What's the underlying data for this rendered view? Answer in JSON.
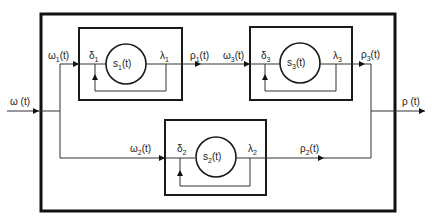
{
  "diagram": {
    "type": "block-diagram",
    "input": {
      "label": "ω",
      "suffix": " (t)"
    },
    "output": {
      "label": "ρ",
      "suffix": " (t)"
    },
    "blocks": [
      {
        "id": "s1",
        "state": "s",
        "index": "1",
        "state_suffix": "(t)",
        "in_label": "δ",
        "out_label": "λ",
        "input_signal": "ω",
        "output_signal": "ρ"
      },
      {
        "id": "s2",
        "state": "s",
        "index": "2",
        "state_suffix": "(t)",
        "in_label": "δ",
        "out_label": "λ",
        "input_signal": "ω",
        "output_signal": "ρ"
      },
      {
        "id": "s3",
        "state": "s",
        "index": "3",
        "state_suffix": "(t)",
        "in_label": "δ",
        "out_label": "λ",
        "input_signal": "ω",
        "output_signal": "ρ"
      }
    ],
    "signal_suffix": "(t)",
    "colors": {
      "line": "#333333",
      "box": "#1a1a1a",
      "background": "#ffffff"
    }
  }
}
